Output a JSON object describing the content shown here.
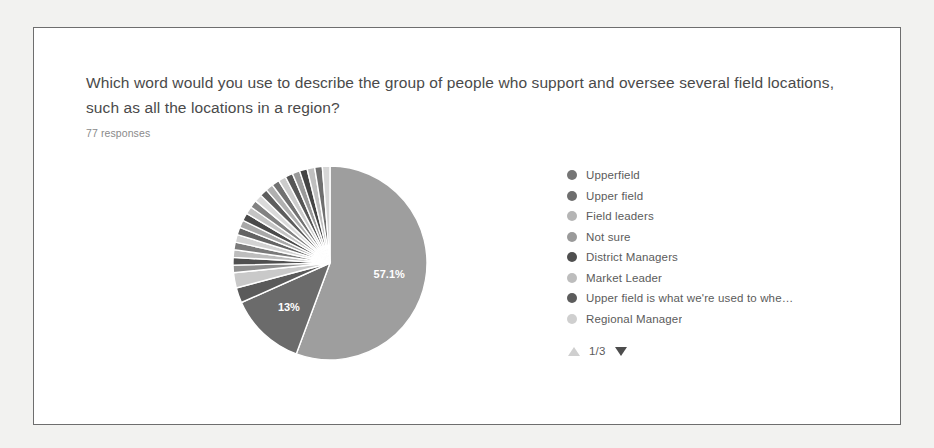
{
  "card": {
    "question": "Which word would you use to describe the group of people who support and oversee several field locations, such as all the locations in a region?",
    "response_count": "77 responses"
  },
  "legend": {
    "items": [
      {
        "label": "Upperfield",
        "color": "#757575"
      },
      {
        "label": "Upper field",
        "color": "#6e6e6e"
      },
      {
        "label": "Field leaders",
        "color": "#b5b5b5"
      },
      {
        "label": "Not sure",
        "color": "#9a9a9a"
      },
      {
        "label": "District Managers",
        "color": "#4f4f4f"
      },
      {
        "label": "Market Leader",
        "color": "#bdbdbd"
      },
      {
        "label": "Upper field is what we're used to whe…",
        "color": "#5c5c5c"
      },
      {
        "label": "Regional Manager",
        "color": "#cfcfcf"
      }
    ]
  },
  "pager": {
    "count": "1/3",
    "up_icon": "triangle-up-icon",
    "down_icon": "triangle-down-icon"
  },
  "chart_data": {
    "type": "pie",
    "title": "Which word would you use to describe the group of people who support and oversee several field locations, such as all the locations in a region?",
    "subtitle": "77 responses",
    "total_responses": 77,
    "legend_position": "right",
    "visible_labels": [
      "57.1%",
      "13%"
    ],
    "start_angle_deg": -90,
    "direction": "clockwise",
    "labels": [
      "Upperfield",
      "Upper field",
      "Field leaders",
      "Not sure",
      "District Managers",
      "Market Leader",
      "Upper field is what we're used to whe…",
      "Regional Manager",
      "Other 1",
      "Other 2",
      "Other 3",
      "Other 4",
      "Other 5",
      "Other 6",
      "Other 7",
      "Other 8",
      "Other 9",
      "Other 10",
      "Other 11",
      "Other 12",
      "Other 13",
      "Other 14",
      "Other 15",
      "Other 16",
      "Other 17"
    ],
    "values": [
      57.1,
      13.0,
      2.6,
      2.6,
      1.3,
      1.3,
      1.3,
      1.3,
      1.3,
      1.3,
      1.3,
      1.3,
      1.3,
      1.3,
      1.3,
      1.3,
      1.3,
      1.3,
      1.3,
      1.3,
      1.3,
      1.3,
      1.3,
      1.3,
      1.3
    ],
    "colors": [
      "#9e9e9e",
      "#6b6b6b",
      "#5a5a5a",
      "#c9c9c9",
      "#8f8f8f",
      "#4f4f4f",
      "#bdbdbd",
      "#7a7a7a",
      "#d2d2d2",
      "#636363",
      "#a8a8a8",
      "#4a4a4a",
      "#c4c4c4",
      "#828282",
      "#dadada",
      "#5e5e5e",
      "#b0b0b0",
      "#717171",
      "#cccccc",
      "#565656",
      "#9a9a9a",
      "#444444",
      "#bfbfbf",
      "#6f6f6f",
      "#d6d6d6"
    ],
    "slice_labels": [
      {
        "text": "57.1%",
        "value": 57.1
      },
      {
        "text": "13%",
        "value": 13.0
      }
    ]
  }
}
